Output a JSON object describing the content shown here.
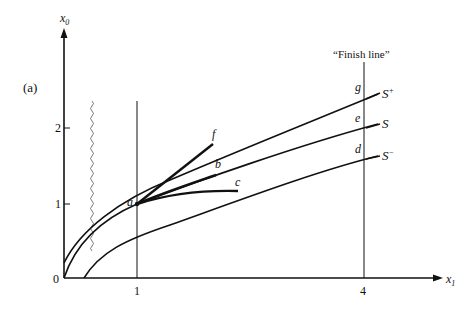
{
  "figure": {
    "panel_label": "(a)",
    "finish_line_label": "“Finish line”",
    "axes": {
      "x_label": "x",
      "x_sub": "1",
      "y_label": "x",
      "y_sub": "0",
      "origin_label": "0",
      "x_ticks": [
        "1",
        "4"
      ],
      "y_ticks": [
        "1",
        "2"
      ]
    },
    "curves": [
      {
        "name": "S+",
        "label": "S",
        "sup": "+"
      },
      {
        "name": "S",
        "label": "S",
        "sup": ""
      },
      {
        "name": "S-",
        "label": "S",
        "sup": "−"
      }
    ],
    "points": {
      "a": "a",
      "b": "b",
      "c": "c",
      "d": "d",
      "e": "e",
      "f": "f",
      "g": "g"
    }
  }
}
